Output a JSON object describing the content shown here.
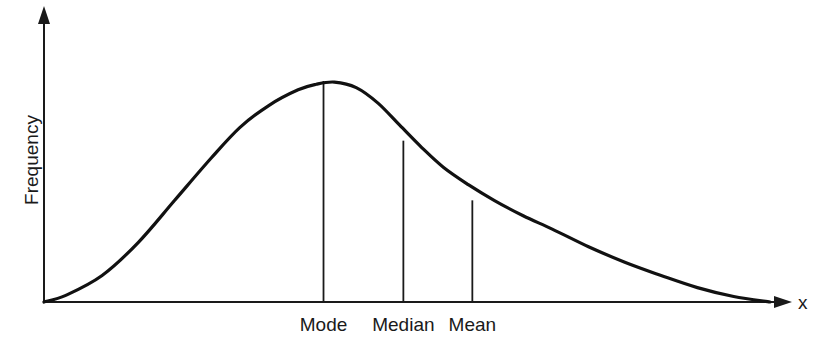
{
  "chart_data": {
    "type": "line",
    "title": "",
    "xlabel": "x",
    "ylabel": "Frequency",
    "xlim": [
      0,
      1
    ],
    "ylim": [
      0,
      1
    ],
    "grid": false,
    "legend": "none",
    "ticks": false,
    "series": [
      {
        "name": "Positively skewed distribution",
        "x": [
          0.0,
          0.03,
          0.08,
          0.13,
          0.18,
          0.23,
          0.27,
          0.31,
          0.35,
          0.375,
          0.4,
          0.43,
          0.46,
          0.49,
          0.52,
          0.55,
          0.585,
          0.62,
          0.66,
          0.7,
          0.75,
          0.8,
          0.85,
          0.9,
          0.95,
          1.0
        ],
        "y": [
          0.0,
          0.03,
          0.12,
          0.27,
          0.46,
          0.65,
          0.79,
          0.89,
          0.96,
          0.985,
          0.995,
          0.97,
          0.9,
          0.8,
          0.7,
          0.61,
          0.53,
          0.46,
          0.39,
          0.33,
          0.25,
          0.18,
          0.12,
          0.065,
          0.025,
          0.0
        ]
      }
    ],
    "annotations": [
      {
        "label": "Mode",
        "x": 0.385,
        "y": 1.0
      },
      {
        "label": "Median",
        "x": 0.495,
        "y": 0.73
      },
      {
        "label": "Mean",
        "x": 0.59,
        "y": 0.46
      }
    ]
  }
}
